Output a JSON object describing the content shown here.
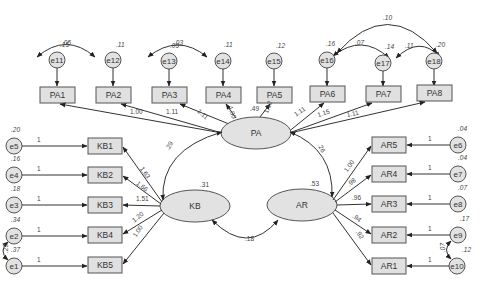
{
  "diagram": {
    "type": "SEM path diagram",
    "latents": [
      {
        "id": "PA",
        "label": "PA",
        "variance": ""
      },
      {
        "id": "KB",
        "label": "KB",
        "variance": ".31"
      },
      {
        "id": "AR",
        "label": "AR",
        "variance": ".53"
      }
    ],
    "pa_indicators": [
      {
        "label": "PA1",
        "loading": "1.00",
        "error": "e11",
        "error_var": ".15"
      },
      {
        "label": "PA2",
        "loading": "1.11",
        "error": "e12",
        "error_var": ".11"
      },
      {
        "label": "PA3",
        "loading": "1.11",
        "error": "e13",
        "error_var": ".09"
      },
      {
        "label": "PA4",
        "loading": "1.00",
        "error": "e14",
        "error_var": ".11"
      },
      {
        "label": "PA5",
        "loading": "1.12",
        "error": "e15",
        "error_var": ".12"
      },
      {
        "label": "PA6",
        "loading": "1.11",
        "error": "e16",
        "error_var": ".16"
      },
      {
        "label": "PA7",
        "loading": "1.15",
        "error": "e17",
        "error_var": ".14"
      },
      {
        "label": "PA8",
        "loading": "1.11",
        "error": "e18",
        "error_var": ".20"
      }
    ],
    "pa_extra_label": ".49",
    "kb_indicators": [
      {
        "label": "KB1",
        "loading": "1.63",
        "error": "e5",
        "error_var": ".20",
        "error_path": "1"
      },
      {
        "label": "KB2",
        "loading": "1.66",
        "error": "e4",
        "error_var": ".16",
        "error_path": "1"
      },
      {
        "label": "KB3",
        "loading": "1.51",
        "error": "e3",
        "error_var": ".18",
        "error_path": "1"
      },
      {
        "label": "KB4",
        "loading": "1.20",
        "error": "e2",
        "error_var": ".34",
        "error_path": "1"
      },
      {
        "label": "KB5",
        "loading": "1.00",
        "error": "e1",
        "error_var": ".37",
        "error_path": "1"
      }
    ],
    "ar_indicators": [
      {
        "label": "AR5",
        "loading": "1.00",
        "error": "e6",
        "error_var": ".04",
        "error_path": "1"
      },
      {
        "label": "AR4",
        "loading": ".98",
        "error": "e7",
        "error_var": ".04",
        "error_path": "1"
      },
      {
        "label": "AR3",
        "loading": ".96",
        "error": "e8",
        "error_var": ".07",
        "error_path": "1"
      },
      {
        "label": "AR2",
        "loading": ".94",
        "error": "e9",
        "error_var": ".17",
        "error_path": "1"
      },
      {
        "label": "AR1",
        "loading": ".92",
        "error": "e10",
        "error_var": ".12",
        "error_path": "1"
      }
    ],
    "error_covariances": [
      {
        "from": "e11",
        "to": "e12",
        "value": ".05"
      },
      {
        "from": "e13",
        "to": "e14",
        "value": ".03"
      },
      {
        "from": "e16",
        "to": "e17",
        "value": ".07"
      },
      {
        "from": "e17",
        "to": "e18",
        "value": ".11"
      },
      {
        "from": "e16",
        "to": "e18",
        "value": ".10"
      },
      {
        "from": "e2",
        "to": "e1",
        "value": ".23"
      },
      {
        "from": "e9",
        "to": "e10",
        "value": ".07"
      }
    ],
    "latent_covariances": [
      {
        "from": "PA",
        "to": "KB",
        "value": ".29"
      },
      {
        "from": "PA",
        "to": "AR",
        "value": ".26"
      },
      {
        "from": "KB",
        "to": "AR",
        "value": ".18"
      }
    ]
  },
  "colors": {
    "node_fill": "#e0e0e0",
    "stroke": "#555555",
    "text": "#333333",
    "background": "#ffffff"
  }
}
